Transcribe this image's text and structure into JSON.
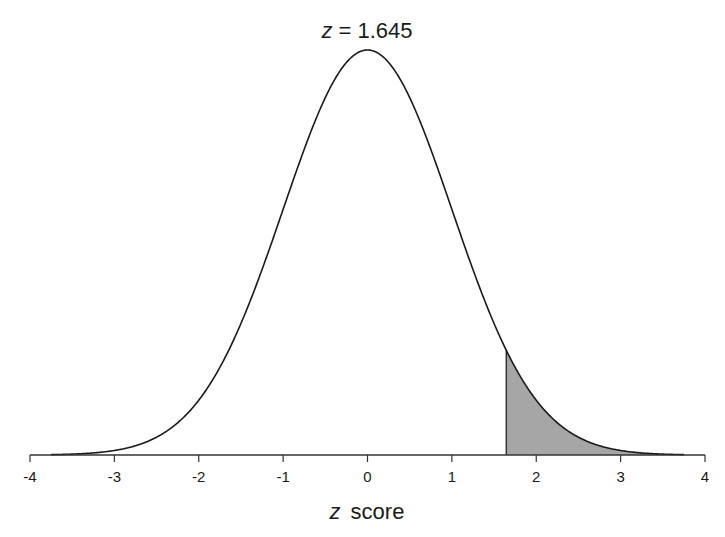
{
  "chart_data": {
    "type": "area",
    "title_var": "z",
    "title_value": "= 1.645",
    "xlabel": "z score",
    "xlabel_var": "z",
    "xlabel_rest": "score",
    "ylabel": "",
    "xlim": [
      -4,
      4
    ],
    "x_ticks": [
      -4,
      -3,
      -2,
      -1,
      0,
      1,
      2,
      3,
      4
    ],
    "x_tick_labels": [
      "-4",
      "-3",
      "-2",
      "-1",
      "0",
      "1",
      "2",
      "3",
      "4"
    ],
    "grid": false,
    "legend": null,
    "curve": {
      "name": "standard normal density",
      "mean": 0,
      "sd": 1,
      "peak_density": 0.3989
    },
    "shaded_region": {
      "from_z": 1.645,
      "to_z": 4,
      "area": 0.05,
      "fill_color": "#a6a6a6"
    },
    "line_color": "#1a1a1a"
  }
}
